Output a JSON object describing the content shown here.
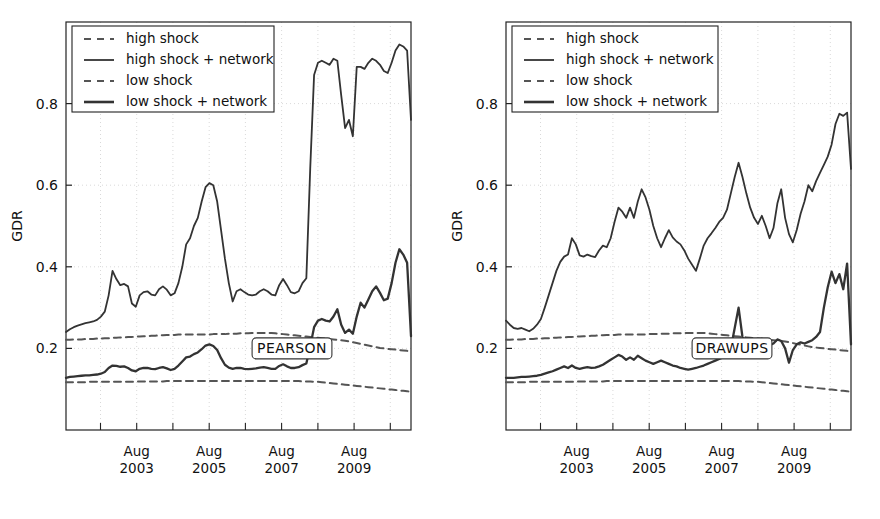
{
  "figure": {
    "background": "#ffffff",
    "line_color": "#333333",
    "dash_color": "#555555",
    "grid_color": "#cfcfcf"
  },
  "chart_data": [
    {
      "type": "line",
      "panel": "left",
      "title": "",
      "annotation": "PEARSON",
      "xlabel": "",
      "ylabel": "GDR",
      "xtick_labels": [
        "Aug\n2003",
        "Aug\n2005",
        "Aug\n2007",
        "Aug\n2009"
      ],
      "xticks_top": [
        "Aug",
        "Aug",
        "Aug",
        "Aug"
      ],
      "xticks_bottom": [
        "2003",
        "2005",
        "2007",
        "2009"
      ],
      "xtick_positions": [
        0.205,
        0.415,
        0.625,
        0.835
      ],
      "ytick_labels": [
        "0.2",
        "0.4",
        "0.6",
        "0.8"
      ],
      "ytick_values": [
        0.2,
        0.4,
        0.6,
        0.8
      ],
      "ylim": [
        0.0,
        1.0
      ],
      "xlim": [
        0,
        1
      ],
      "grid": true,
      "legend_position": "upper left",
      "legend": [
        "high shock",
        "high shock + network",
        "low shock",
        "low shock + network"
      ],
      "series": [
        {
          "name": "high shock",
          "style": "dashed",
          "values": [
            0.221,
            0.221,
            0.222,
            0.222,
            0.222,
            0.223,
            0.223,
            0.223,
            0.224,
            0.224,
            0.225,
            0.225,
            0.226,
            0.226,
            0.227,
            0.227,
            0.228,
            0.228,
            0.229,
            0.229,
            0.23,
            0.23,
            0.231,
            0.231,
            0.232,
            0.232,
            0.233,
            0.233,
            0.233,
            0.234,
            0.234,
            0.234,
            0.234,
            0.234,
            0.234,
            0.234,
            0.234,
            0.234,
            0.235,
            0.235,
            0.235,
            0.235,
            0.236,
            0.236,
            0.236,
            0.237,
            0.237,
            0.237,
            0.238,
            0.238,
            0.238,
            0.238,
            0.238,
            0.238,
            0.237,
            0.236,
            0.235,
            0.234,
            0.233,
            0.232,
            0.231,
            0.23,
            0.229,
            0.228,
            0.227,
            0.226,
            0.225,
            0.224,
            0.223,
            0.222,
            0.221,
            0.22,
            0.219,
            0.217,
            0.215,
            0.213,
            0.211,
            0.209,
            0.207,
            0.205,
            0.203,
            0.201,
            0.2,
            0.199,
            0.198,
            0.197,
            0.196,
            0.195,
            0.194,
            0.193
          ]
        },
        {
          "name": "high shock + network",
          "style": "solid",
          "values": [
            0.24,
            0.247,
            0.252,
            0.256,
            0.259,
            0.262,
            0.264,
            0.266,
            0.27,
            0.278,
            0.29,
            0.33,
            0.39,
            0.37,
            0.355,
            0.358,
            0.352,
            0.31,
            0.302,
            0.33,
            0.338,
            0.34,
            0.332,
            0.33,
            0.345,
            0.352,
            0.344,
            0.33,
            0.335,
            0.36,
            0.4,
            0.455,
            0.47,
            0.5,
            0.52,
            0.56,
            0.595,
            0.605,
            0.6,
            0.56,
            0.49,
            0.42,
            0.36,
            0.315,
            0.34,
            0.345,
            0.338,
            0.332,
            0.33,
            0.332,
            0.34,
            0.345,
            0.34,
            0.332,
            0.33,
            0.355,
            0.37,
            0.355,
            0.338,
            0.335,
            0.34,
            0.36,
            0.372,
            0.64,
            0.87,
            0.9,
            0.905,
            0.9,
            0.895,
            0.91,
            0.905,
            0.82,
            0.74,
            0.76,
            0.72,
            0.89,
            0.89,
            0.885,
            0.9,
            0.91,
            0.905,
            0.895,
            0.88,
            0.875,
            0.9,
            0.93,
            0.945,
            0.94,
            0.93,
            0.76
          ]
        },
        {
          "name": "low shock",
          "style": "dashed",
          "values": [
            0.117,
            0.117,
            0.117,
            0.117,
            0.117,
            0.117,
            0.118,
            0.118,
            0.118,
            0.118,
            0.118,
            0.118,
            0.118,
            0.118,
            0.118,
            0.118,
            0.118,
            0.118,
            0.119,
            0.119,
            0.119,
            0.119,
            0.119,
            0.119,
            0.119,
            0.119,
            0.12,
            0.12,
            0.12,
            0.12,
            0.12,
            0.12,
            0.12,
            0.12,
            0.12,
            0.12,
            0.12,
            0.12,
            0.12,
            0.12,
            0.12,
            0.12,
            0.12,
            0.12,
            0.12,
            0.12,
            0.12,
            0.12,
            0.12,
            0.12,
            0.12,
            0.12,
            0.12,
            0.12,
            0.12,
            0.12,
            0.12,
            0.12,
            0.12,
            0.12,
            0.12,
            0.119,
            0.119,
            0.119,
            0.118,
            0.118,
            0.117,
            0.116,
            0.115,
            0.114,
            0.113,
            0.112,
            0.111,
            0.11,
            0.109,
            0.108,
            0.107,
            0.106,
            0.105,
            0.104,
            0.103,
            0.102,
            0.101,
            0.1,
            0.099,
            0.098,
            0.097,
            0.096,
            0.095,
            0.094
          ]
        },
        {
          "name": "low shock + network",
          "style": "solid-thick",
          "values": [
            0.128,
            0.13,
            0.131,
            0.132,
            0.133,
            0.134,
            0.134,
            0.135,
            0.136,
            0.138,
            0.142,
            0.152,
            0.158,
            0.157,
            0.155,
            0.156,
            0.152,
            0.146,
            0.144,
            0.15,
            0.152,
            0.152,
            0.15,
            0.149,
            0.152,
            0.154,
            0.151,
            0.147,
            0.15,
            0.158,
            0.168,
            0.178,
            0.18,
            0.186,
            0.19,
            0.198,
            0.207,
            0.21,
            0.206,
            0.196,
            0.176,
            0.16,
            0.153,
            0.15,
            0.152,
            0.152,
            0.15,
            0.149,
            0.15,
            0.151,
            0.153,
            0.154,
            0.152,
            0.15,
            0.15,
            0.157,
            0.161,
            0.156,
            0.152,
            0.152,
            0.154,
            0.159,
            0.163,
            0.205,
            0.252,
            0.268,
            0.272,
            0.268,
            0.266,
            0.278,
            0.296,
            0.258,
            0.238,
            0.246,
            0.236,
            0.278,
            0.312,
            0.3,
            0.32,
            0.34,
            0.352,
            0.336,
            0.318,
            0.322,
            0.36,
            0.41,
            0.443,
            0.43,
            0.41,
            0.23
          ]
        }
      ]
    },
    {
      "type": "line",
      "panel": "right",
      "title": "",
      "annotation": "DRAWUPS",
      "xlabel": "",
      "ylabel": "GDR",
      "xtick_labels": [
        "Aug\n2003",
        "Aug\n2005",
        "Aug\n2007",
        "Aug\n2009"
      ],
      "xticks_top": [
        "Aug",
        "Aug",
        "Aug",
        "Aug"
      ],
      "xticks_bottom": [
        "2003",
        "2005",
        "2007",
        "2009"
      ],
      "xtick_positions": [
        0.205,
        0.415,
        0.625,
        0.835
      ],
      "ytick_labels": [
        "0.2",
        "0.4",
        "0.6",
        "0.8"
      ],
      "ytick_values": [
        0.2,
        0.4,
        0.6,
        0.8
      ],
      "ylim": [
        0.0,
        1.0
      ],
      "xlim": [
        0,
        1
      ],
      "grid": true,
      "legend_position": "upper left",
      "legend": [
        "high shock",
        "high shock + network",
        "low shock",
        "low shock + network"
      ],
      "series": [
        {
          "name": "high shock",
          "style": "dashed",
          "values": [
            0.221,
            0.221,
            0.222,
            0.222,
            0.222,
            0.223,
            0.223,
            0.223,
            0.224,
            0.224,
            0.225,
            0.225,
            0.226,
            0.226,
            0.227,
            0.227,
            0.228,
            0.228,
            0.229,
            0.229,
            0.23,
            0.23,
            0.231,
            0.231,
            0.232,
            0.232,
            0.233,
            0.233,
            0.233,
            0.234,
            0.234,
            0.234,
            0.234,
            0.234,
            0.234,
            0.234,
            0.234,
            0.235,
            0.235,
            0.235,
            0.236,
            0.236,
            0.236,
            0.237,
            0.237,
            0.237,
            0.238,
            0.238,
            0.238,
            0.238,
            0.238,
            0.238,
            0.237,
            0.236,
            0.235,
            0.234,
            0.233,
            0.232,
            0.231,
            0.23,
            0.229,
            0.228,
            0.227,
            0.226,
            0.225,
            0.224,
            0.223,
            0.222,
            0.221,
            0.22,
            0.219,
            0.218,
            0.217,
            0.215,
            0.213,
            0.211,
            0.209,
            0.207,
            0.205,
            0.203,
            0.202,
            0.201,
            0.2,
            0.199,
            0.198,
            0.197,
            0.196,
            0.195,
            0.194,
            0.193
          ]
        },
        {
          "name": "high shock + network",
          "style": "solid",
          "values": [
            0.268,
            0.258,
            0.25,
            0.248,
            0.25,
            0.246,
            0.242,
            0.248,
            0.258,
            0.272,
            0.3,
            0.33,
            0.36,
            0.39,
            0.412,
            0.425,
            0.43,
            0.47,
            0.455,
            0.428,
            0.425,
            0.43,
            0.426,
            0.424,
            0.44,
            0.452,
            0.448,
            0.47,
            0.51,
            0.545,
            0.535,
            0.52,
            0.545,
            0.52,
            0.56,
            0.59,
            0.57,
            0.54,
            0.5,
            0.47,
            0.448,
            0.47,
            0.49,
            0.472,
            0.462,
            0.455,
            0.44,
            0.42,
            0.405,
            0.39,
            0.42,
            0.452,
            0.47,
            0.482,
            0.495,
            0.51,
            0.52,
            0.54,
            0.58,
            0.62,
            0.655,
            0.62,
            0.58,
            0.545,
            0.52,
            0.505,
            0.525,
            0.5,
            0.47,
            0.495,
            0.555,
            0.59,
            0.52,
            0.48,
            0.46,
            0.49,
            0.53,
            0.56,
            0.6,
            0.585,
            0.61,
            0.63,
            0.65,
            0.67,
            0.7,
            0.75,
            0.775,
            0.77,
            0.778,
            0.64
          ]
        },
        {
          "name": "low shock",
          "style": "dashed",
          "values": [
            0.117,
            0.117,
            0.117,
            0.117,
            0.117,
            0.117,
            0.118,
            0.118,
            0.118,
            0.118,
            0.118,
            0.118,
            0.118,
            0.118,
            0.118,
            0.118,
            0.118,
            0.118,
            0.119,
            0.119,
            0.119,
            0.119,
            0.119,
            0.119,
            0.119,
            0.119,
            0.12,
            0.12,
            0.12,
            0.12,
            0.12,
            0.12,
            0.12,
            0.12,
            0.12,
            0.12,
            0.12,
            0.12,
            0.12,
            0.12,
            0.12,
            0.12,
            0.12,
            0.12,
            0.12,
            0.12,
            0.12,
            0.12,
            0.12,
            0.12,
            0.12,
            0.12,
            0.12,
            0.12,
            0.12,
            0.12,
            0.12,
            0.12,
            0.12,
            0.12,
            0.12,
            0.119,
            0.119,
            0.119,
            0.118,
            0.118,
            0.117,
            0.116,
            0.115,
            0.114,
            0.113,
            0.112,
            0.111,
            0.11,
            0.109,
            0.108,
            0.107,
            0.106,
            0.105,
            0.104,
            0.103,
            0.102,
            0.101,
            0.1,
            0.099,
            0.098,
            0.097,
            0.096,
            0.095,
            0.094
          ]
        },
        {
          "name": "low shock + network",
          "style": "solid-thick",
          "values": [
            0.128,
            0.128,
            0.128,
            0.129,
            0.13,
            0.13,
            0.131,
            0.132,
            0.133,
            0.135,
            0.138,
            0.141,
            0.144,
            0.148,
            0.152,
            0.156,
            0.152,
            0.158,
            0.152,
            0.15,
            0.152,
            0.154,
            0.152,
            0.153,
            0.156,
            0.16,
            0.166,
            0.172,
            0.178,
            0.184,
            0.18,
            0.172,
            0.178,
            0.172,
            0.182,
            0.176,
            0.17,
            0.166,
            0.162,
            0.166,
            0.17,
            0.166,
            0.162,
            0.158,
            0.156,
            0.152,
            0.15,
            0.148,
            0.15,
            0.152,
            0.155,
            0.158,
            0.162,
            0.166,
            0.17,
            0.174,
            0.178,
            0.18,
            0.2,
            0.25,
            0.3,
            0.228,
            0.212,
            0.215,
            0.222,
            0.218,
            0.224,
            0.216,
            0.208,
            0.212,
            0.222,
            0.218,
            0.2,
            0.165,
            0.196,
            0.21,
            0.215,
            0.212,
            0.216,
            0.22,
            0.228,
            0.24,
            0.3,
            0.35,
            0.388,
            0.36,
            0.382,
            0.345,
            0.408,
            0.21
          ]
        }
      ]
    }
  ]
}
